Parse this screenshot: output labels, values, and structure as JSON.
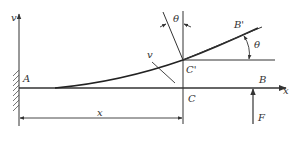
{
  "diagram": {
    "type": "cantilever-beam-deflection",
    "colors": {
      "line": "#333333",
      "curve": "#222222",
      "background": "#ffffff"
    },
    "labels": {
      "v_axis": "v",
      "x_axis": "x",
      "point_a": "A",
      "point_b": "B",
      "point_b_prime": "B'",
      "point_c": "C",
      "point_c_prime": "C'",
      "deflection_v": "v",
      "theta_top": "θ",
      "theta_right": "θ",
      "distance_x": "x",
      "force": "F"
    }
  }
}
